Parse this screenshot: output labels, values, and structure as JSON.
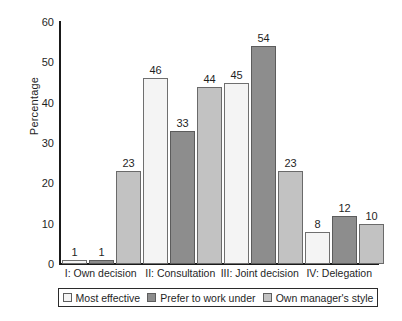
{
  "chart_data": {
    "type": "bar",
    "title": "",
    "xlabel": "",
    "ylabel": "Percentage",
    "ylim": [
      0,
      60
    ],
    "yticks": [
      60,
      50,
      40,
      30,
      20,
      10,
      0
    ],
    "grid": false,
    "legend_position": "bottom",
    "categories": [
      "I: Own decision",
      "II: Consultation",
      "III: Joint decision",
      "IV: Delegation"
    ],
    "series": [
      {
        "name": "Most effective",
        "color": "#f4f4f4",
        "values": [
          1,
          46,
          45,
          8
        ]
      },
      {
        "name": "Prefer to work under",
        "color": "#8d8d8d",
        "values": [
          1,
          33,
          54,
          12
        ]
      },
      {
        "name": "Own manager's style",
        "color": "#c2c2c2",
        "values": [
          23,
          44,
          23,
          10
        ]
      }
    ]
  },
  "axis": {
    "y_label": "Percentage",
    "y_ticks": [
      "60",
      "50",
      "40",
      "30",
      "20",
      "10",
      "0"
    ]
  },
  "legend": {
    "items": [
      {
        "label": "Most effective"
      },
      {
        "label": "Prefer to work under"
      },
      {
        "label": "Own manager's style"
      }
    ]
  },
  "colors": {
    "series_1": "#f4f4f4",
    "series_2": "#8d8d8d",
    "series_3": "#c2c2c2",
    "axis": "#1a1a1a",
    "text": "#1f1f1f",
    "background": "#ffffff"
  }
}
